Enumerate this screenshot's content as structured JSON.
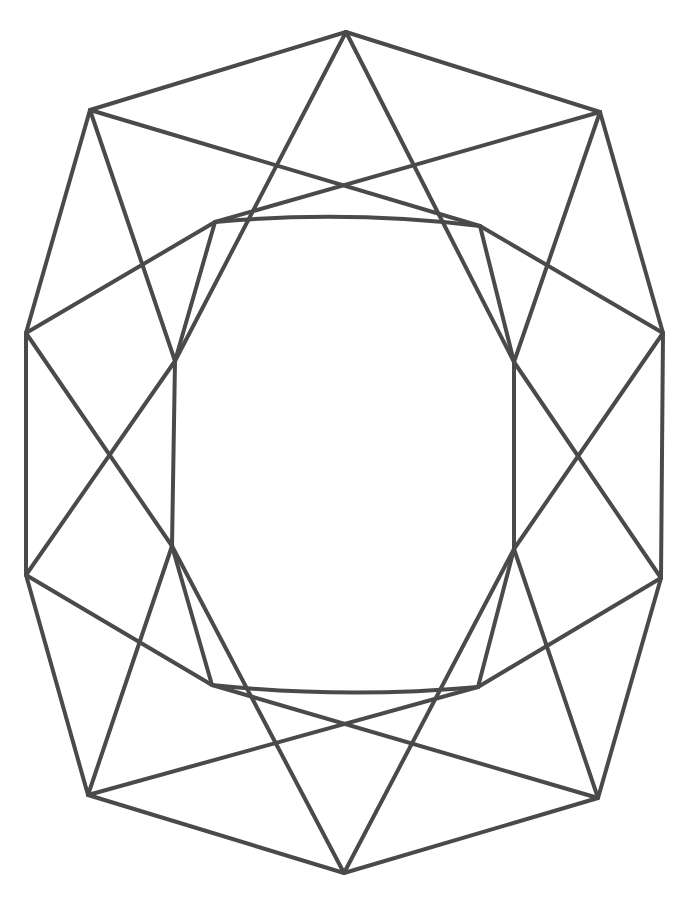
{
  "figure": {
    "name": "cushion-cut-gemstone-facet-diagram",
    "type": "line-drawing",
    "width": 692,
    "height": 900,
    "background_color": "#ffffff",
    "stroke_color": "#4a4a4a",
    "stroke_width": 4,
    "stroke_linecap": "round",
    "stroke_linejoin": "round",
    "fill": "none",
    "title": "",
    "labels": [],
    "annotations": []
  },
  "geometry": {
    "description": "Octagonal cushion-cut gem outline with inner table octagon and crown/pavilion facet lines",
    "points": {
      "outer_top": [
        346,
        32
      ],
      "outer_top_left": [
        90,
        110
      ],
      "outer_top_right": [
        600,
        112
      ],
      "outer_left_upper": [
        26,
        333
      ],
      "outer_right_upper": [
        663,
        333
      ],
      "outer_left_lower": [
        26,
        575
      ],
      "outer_right_lower": [
        661,
        578
      ],
      "outer_bottom_left": [
        88,
        795
      ],
      "outer_bottom_right": [
        598,
        798
      ],
      "outer_bottom": [
        344,
        873
      ],
      "table_top_left": [
        215,
        222
      ],
      "table_top_right": [
        480,
        226
      ],
      "table_left_upper": [
        175,
        361
      ],
      "table_right_upper": [
        514,
        362
      ],
      "table_left_lower": [
        172,
        546
      ],
      "table_right_lower": [
        514,
        549
      ],
      "table_bottom_left": [
        212,
        685
      ],
      "table_bottom_right": [
        478,
        687
      ]
    },
    "outer_outline": [
      "outer_top",
      "outer_top_right",
      "outer_right_upper",
      "outer_right_lower",
      "outer_bottom_right",
      "outer_bottom",
      "outer_bottom_left",
      "outer_left_lower",
      "outer_left_upper",
      "outer_top_left"
    ],
    "table_outline": [
      "table_top_left",
      "table_top_right",
      "table_right_upper",
      "table_right_lower",
      "table_bottom_right",
      "table_bottom_left",
      "table_left_lower",
      "table_left_upper"
    ],
    "table_curved_edges": {
      "top": {
        "from": "table_top_left",
        "to": "table_top_right",
        "control": [
          347,
          210
        ]
      },
      "bottom": {
        "from": "table_bottom_left",
        "to": "table_bottom_right",
        "control": [
          345,
          699
        ]
      }
    },
    "facet_lines": [
      {
        "name": "crown-star-left",
        "from": "outer_top",
        "to": "table_left_upper"
      },
      {
        "name": "crown-star-right",
        "from": "outer_top",
        "to": "table_right_upper"
      },
      {
        "name": "crown-girdle-left",
        "from": "outer_top_left",
        "to": "table_top_right"
      },
      {
        "name": "crown-girdle-right",
        "from": "outer_top_right",
        "to": "table_top_left"
      },
      {
        "name": "crown-kite-left",
        "from": "outer_top_left",
        "to": "table_left_upper"
      },
      {
        "name": "crown-kite-right",
        "from": "outer_top_right",
        "to": "table_right_upper"
      },
      {
        "name": "upper-girdle-left",
        "from": "outer_left_upper",
        "to": "table_top_left"
      },
      {
        "name": "upper-girdle-right",
        "from": "outer_right_upper",
        "to": "table_top_right"
      },
      {
        "name": "left-panel-diagonal-down",
        "from": "outer_left_upper",
        "to": "table_left_lower"
      },
      {
        "name": "left-panel-diagonal-up",
        "from": "outer_left_lower",
        "to": "table_left_upper"
      },
      {
        "name": "right-panel-diagonal-down",
        "from": "outer_right_upper",
        "to": "table_right_lower"
      },
      {
        "name": "right-panel-diagonal-up",
        "from": "outer_right_lower",
        "to": "table_right_upper"
      },
      {
        "name": "lower-girdle-left",
        "from": "outer_left_lower",
        "to": "table_bottom_left"
      },
      {
        "name": "lower-girdle-right",
        "from": "outer_right_lower",
        "to": "table_bottom_right"
      },
      {
        "name": "pavilion-kite-left",
        "from": "outer_bottom_left",
        "to": "table_left_lower"
      },
      {
        "name": "pavilion-kite-right",
        "from": "outer_bottom_right",
        "to": "table_right_lower"
      },
      {
        "name": "pavilion-girdle-left",
        "from": "outer_bottom_left",
        "to": "table_bottom_right"
      },
      {
        "name": "pavilion-girdle-right",
        "from": "outer_bottom_right",
        "to": "table_bottom_left"
      },
      {
        "name": "pavilion-star-left",
        "from": "outer_bottom",
        "to": "table_left_lower"
      },
      {
        "name": "pavilion-star-right",
        "from": "outer_bottom",
        "to": "table_right_lower"
      }
    ]
  }
}
